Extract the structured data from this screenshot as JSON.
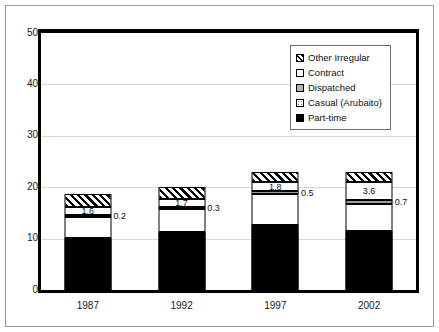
{
  "chart_data": {
    "type": "bar",
    "stacked": true,
    "title": "",
    "subtitle": "",
    "xlabel": "",
    "ylabel": "",
    "categories": [
      "1987",
      "1992",
      "1997",
      "2002"
    ],
    "ylim": [
      0,
      50
    ],
    "yticks": [
      0,
      10,
      20,
      30,
      40,
      50
    ],
    "ytick_labels": [
      "0",
      "10",
      "20",
      "30",
      "40",
      "50"
    ],
    "grid": true,
    "legend_position": "top-right",
    "series": [
      {
        "name": "Part-time",
        "pattern": "solid-black",
        "values": [
          10.2,
          11.3,
          12.6,
          11.4
        ],
        "labels": [
          "",
          "",
          "",
          ""
        ]
      },
      {
        "name": "Casual (Arubaito)",
        "pattern": "dotted",
        "values": [
          4.0,
          4.4,
          6.1,
          5.4
        ],
        "labels": [
          "",
          "",
          "",
          ""
        ]
      },
      {
        "name": "Dispatched",
        "pattern": "gray",
        "values": [
          0.2,
          0.3,
          0.5,
          0.7
        ],
        "labels": [
          "0.2",
          "0.3",
          "0.5",
          "0.7"
        ],
        "label_position": "outside-right"
      },
      {
        "name": "Contract",
        "pattern": "white",
        "values": [
          1.6,
          1.7,
          1.8,
          3.6
        ],
        "labels": [
          "1.6",
          "1.7",
          "1.8",
          "3.6"
        ],
        "label_position": "inside-center"
      },
      {
        "name": "Other Irregular",
        "pattern": "diagonal-hatch",
        "values": [
          2.5,
          2.3,
          2.0,
          1.9
        ],
        "labels": [
          "",
          "",
          "",
          ""
        ]
      }
    ],
    "totals": [
      18.5,
      20.0,
      23.0,
      23.0
    ]
  },
  "legend": {
    "items": [
      {
        "label": "Other Irregular",
        "swatch": "diagonal-hatch-swatch"
      },
      {
        "label": "Contract",
        "swatch": "white-swatch"
      },
      {
        "label": "Dispatched",
        "swatch": "gray-swatch"
      },
      {
        "label": "Casual (Arubaito)",
        "swatch": "dotted-swatch"
      },
      {
        "label": "Part-time",
        "swatch": "black-swatch"
      }
    ]
  },
  "colors": {
    "axis": "#000000",
    "grid": "#d8d8d8",
    "text": "#111111",
    "part_time": "#000000",
    "dispatched": "#9d9d9d",
    "background": "#ffffff"
  }
}
